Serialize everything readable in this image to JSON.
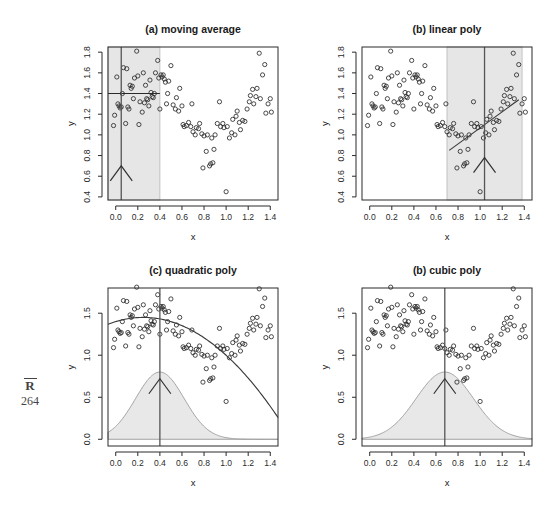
{
  "margin": {
    "label": "R",
    "page_number": "264"
  },
  "figure": {
    "shared_xlabel": "x",
    "shared_ylabel": "y"
  },
  "chart_data": [
    {
      "type": "scatter",
      "panel": "a",
      "title": "(a) moving average",
      "xlabel": "x",
      "ylabel": "y",
      "xlim": [
        -0.07,
        1.47
      ],
      "ylim": [
        0.37,
        1.85
      ],
      "xticks": [
        0.0,
        0.2,
        0.4,
        0.6,
        0.8,
        1.0,
        1.2,
        1.4
      ],
      "xticklabels": [
        "0.0",
        "0.2",
        "0.4",
        "0.6",
        "0.8",
        "1.0",
        "1.2",
        "1.4"
      ],
      "yticks": [
        0.4,
        0.6,
        0.8,
        1.0,
        1.2,
        1.4,
        1.6,
        1.8
      ],
      "yticklabels": [
        "0.4",
        "0.6",
        "0.8",
        "1.0",
        "1.2",
        "1.4",
        "1.6",
        "1.8"
      ],
      "grid": false,
      "legend": "none",
      "annotations": {
        "band": {
          "x_start": -0.07,
          "x_end": 0.4,
          "label": "moving-average window"
        },
        "focus_x": 0.05,
        "horizontal_fit_segment": {
          "y": 1.4,
          "x_start": -0.07,
          "x_end": 0.4
        },
        "arrow_at_x": 0.05,
        "arrow_tip_y": 0.7
      },
      "x": [
        -0.02,
        -0.01,
        0.01,
        0.02,
        0.03,
        0.04,
        0.05,
        0.06,
        0.07,
        0.09,
        0.1,
        0.11,
        0.12,
        0.13,
        0.14,
        0.15,
        0.16,
        0.17,
        0.19,
        0.2,
        0.21,
        0.22,
        0.24,
        0.25,
        0.26,
        0.27,
        0.28,
        0.29,
        0.3,
        0.31,
        0.32,
        0.33,
        0.34,
        0.35,
        0.36,
        0.38,
        0.39,
        0.4,
        0.41,
        0.42,
        0.43,
        0.44,
        0.45,
        0.46,
        0.47,
        0.48,
        0.5,
        0.52,
        0.54,
        0.55,
        0.57,
        0.58,
        0.6,
        0.61,
        0.62,
        0.64,
        0.66,
        0.68,
        0.69,
        0.7,
        0.72,
        0.73,
        0.75,
        0.76,
        0.78,
        0.79,
        0.8,
        0.82,
        0.83,
        0.85,
        0.86,
        0.87,
        0.88,
        0.89,
        0.9,
        0.92,
        0.94,
        0.95,
        0.97,
        0.98,
        1.0,
        1.01,
        1.03,
        1.05,
        1.06,
        1.08,
        1.09,
        1.1,
        1.12,
        1.13,
        1.15,
        1.17,
        1.19,
        1.21,
        1.22,
        1.24,
        1.25,
        1.27,
        1.28,
        1.3,
        1.31,
        1.33,
        1.35,
        1.36,
        1.38,
        1.4,
        1.41
      ],
      "y": [
        1.09,
        1.19,
        1.56,
        1.3,
        1.28,
        1.26,
        1.27,
        1.4,
        1.65,
        1.11,
        1.64,
        1.27,
        1.25,
        1.48,
        1.45,
        1.47,
        1.35,
        1.55,
        1.81,
        1.57,
        1.1,
        1.32,
        1.22,
        1.6,
        1.31,
        1.48,
        1.35,
        1.34,
        1.28,
        1.53,
        1.41,
        1.37,
        1.36,
        1.4,
        1.6,
        1.72,
        1.55,
        1.25,
        1.58,
        1.56,
        1.58,
        1.54,
        1.51,
        1.3,
        1.4,
        1.52,
        1.67,
        1.29,
        1.25,
        1.36,
        1.23,
        1.45,
        1.28,
        1.1,
        1.08,
        1.09,
        1.12,
        1.08,
        1.3,
        1.03,
        1.0,
        1.07,
        1.06,
        1.11,
        1.01,
        0.68,
        0.99,
        0.84,
        1.0,
        0.7,
        0.72,
        0.97,
        0.73,
        0.86,
        1.0,
        1.11,
        1.32,
        1.08,
        1.11,
        1.07,
        0.45,
        1.08,
        0.97,
        1.02,
        1.15,
        1.0,
        1.18,
        1.23,
        1.12,
        1.05,
        1.14,
        1.13,
        1.25,
        1.32,
        1.38,
        1.44,
        1.3,
        1.37,
        1.45,
        1.79,
        1.35,
        1.58,
        1.68,
        1.21,
        1.3,
        1.35,
        1.22
      ]
    },
    {
      "type": "scatter",
      "panel": "b",
      "title": "(b) linear poly",
      "xlabel": "x",
      "ylabel": "y",
      "xlim": [
        -0.07,
        1.47
      ],
      "ylim": [
        0.37,
        1.85
      ],
      "xticks": [
        0.0,
        0.2,
        0.4,
        0.6,
        0.8,
        1.0,
        1.2,
        1.4
      ],
      "xticklabels": [
        "0.0",
        "0.2",
        "0.4",
        "0.6",
        "0.8",
        "1.0",
        "1.2",
        "1.4"
      ],
      "yticks": [
        0.4,
        0.6,
        0.8,
        1.0,
        1.2,
        1.4,
        1.6,
        1.8
      ],
      "yticklabels": [
        "0.4",
        "0.6",
        "0.8",
        "1.0",
        "1.2",
        "1.4",
        "1.6",
        "1.8"
      ],
      "grid": false,
      "legend": "none",
      "annotations": {
        "band": {
          "x_start": 0.7,
          "x_end": 1.38,
          "label": "local linear window"
        },
        "focus_x": 1.04,
        "fit_line": {
          "x_start": 0.72,
          "y_start": 0.85,
          "x_end": 1.35,
          "y_end": 1.34
        },
        "arrow_at_x": 1.04,
        "arrow_tip_y": 0.78
      },
      "x": [
        -0.02,
        -0.01,
        0.01,
        0.02,
        0.03,
        0.04,
        0.05,
        0.06,
        0.07,
        0.09,
        0.1,
        0.11,
        0.12,
        0.13,
        0.14,
        0.15,
        0.16,
        0.17,
        0.19,
        0.2,
        0.21,
        0.22,
        0.24,
        0.25,
        0.26,
        0.27,
        0.28,
        0.29,
        0.3,
        0.31,
        0.32,
        0.33,
        0.34,
        0.35,
        0.36,
        0.38,
        0.39,
        0.4,
        0.41,
        0.42,
        0.43,
        0.44,
        0.45,
        0.46,
        0.47,
        0.48,
        0.5,
        0.52,
        0.54,
        0.55,
        0.57,
        0.58,
        0.6,
        0.61,
        0.62,
        0.64,
        0.66,
        0.68,
        0.69,
        0.7,
        0.72,
        0.73,
        0.75,
        0.76,
        0.78,
        0.79,
        0.8,
        0.82,
        0.83,
        0.85,
        0.86,
        0.87,
        0.88,
        0.89,
        0.9,
        0.92,
        0.94,
        0.95,
        0.97,
        0.98,
        1.0,
        1.01,
        1.03,
        1.05,
        1.06,
        1.08,
        1.09,
        1.1,
        1.12,
        1.13,
        1.15,
        1.17,
        1.19,
        1.21,
        1.22,
        1.24,
        1.25,
        1.27,
        1.28,
        1.3,
        1.31,
        1.33,
        1.35,
        1.36,
        1.38,
        1.4,
        1.41
      ],
      "y": [
        1.09,
        1.19,
        1.56,
        1.3,
        1.28,
        1.26,
        1.27,
        1.4,
        1.65,
        1.11,
        1.64,
        1.27,
        1.25,
        1.48,
        1.45,
        1.47,
        1.35,
        1.55,
        1.81,
        1.57,
        1.1,
        1.32,
        1.22,
        1.6,
        1.31,
        1.48,
        1.35,
        1.34,
        1.28,
        1.53,
        1.41,
        1.37,
        1.36,
        1.4,
        1.6,
        1.72,
        1.55,
        1.25,
        1.58,
        1.56,
        1.58,
        1.54,
        1.51,
        1.3,
        1.4,
        1.52,
        1.67,
        1.29,
        1.25,
        1.36,
        1.23,
        1.45,
        1.28,
        1.1,
        1.08,
        1.09,
        1.12,
        1.08,
        1.3,
        1.03,
        1.0,
        1.07,
        1.06,
        1.11,
        1.01,
        0.68,
        0.99,
        0.84,
        1.0,
        0.7,
        0.72,
        0.97,
        0.73,
        0.86,
        1.0,
        1.11,
        1.32,
        1.08,
        1.11,
        1.07,
        0.45,
        1.08,
        0.97,
        1.02,
        1.15,
        1.0,
        1.18,
        1.23,
        1.12,
        1.05,
        1.14,
        1.13,
        1.25,
        1.32,
        1.38,
        1.44,
        1.3,
        1.37,
        1.45,
        1.79,
        1.35,
        1.58,
        1.68,
        1.21,
        1.3,
        1.35,
        1.22
      ]
    },
    {
      "type": "scatter",
      "panel": "c",
      "title": "(c) quadratic poly",
      "xlabel": "x",
      "ylabel": "y",
      "xlim": [
        -0.07,
        1.47
      ],
      "ylim": [
        -0.08,
        1.8
      ],
      "xticks": [
        0.0,
        0.2,
        0.4,
        0.6,
        0.8,
        1.0,
        1.2,
        1.4
      ],
      "xticklabels": [
        "0.0",
        "0.2",
        "0.4",
        "0.6",
        "0.8",
        "1.0",
        "1.2",
        "1.4"
      ],
      "yticks": [
        0.0,
        0.5,
        1.0,
        1.5
      ],
      "yticklabels": [
        "0.0",
        "0.5",
        "1.0",
        "1.5"
      ],
      "grid": false,
      "legend": "none",
      "annotations": {
        "focus_x": 0.4,
        "kernel": {
          "center": 0.4,
          "bandwidth": 0.22,
          "peak_height": 0.8,
          "shaded": true
        },
        "fit_curve": {
          "form": "quadratic",
          "vertex_x": 0.25,
          "vertex_y": 1.45,
          "curvature": -0.8
        },
        "arrow_at_x": 0.4,
        "arrow_tip_y": 0.72
      },
      "x": [
        -0.02,
        -0.01,
        0.01,
        0.02,
        0.03,
        0.04,
        0.05,
        0.06,
        0.07,
        0.09,
        0.1,
        0.11,
        0.12,
        0.13,
        0.14,
        0.15,
        0.16,
        0.17,
        0.19,
        0.2,
        0.21,
        0.22,
        0.24,
        0.25,
        0.26,
        0.27,
        0.28,
        0.29,
        0.3,
        0.31,
        0.32,
        0.33,
        0.34,
        0.35,
        0.36,
        0.38,
        0.39,
        0.4,
        0.41,
        0.42,
        0.43,
        0.44,
        0.45,
        0.46,
        0.47,
        0.48,
        0.5,
        0.52,
        0.54,
        0.55,
        0.57,
        0.58,
        0.6,
        0.61,
        0.62,
        0.64,
        0.66,
        0.68,
        0.69,
        0.7,
        0.72,
        0.73,
        0.75,
        0.76,
        0.78,
        0.79,
        0.8,
        0.82,
        0.83,
        0.85,
        0.86,
        0.87,
        0.88,
        0.89,
        0.9,
        0.92,
        0.94,
        0.95,
        0.97,
        0.98,
        1.0,
        1.01,
        1.03,
        1.05,
        1.06,
        1.08,
        1.09,
        1.1,
        1.12,
        1.13,
        1.15,
        1.17,
        1.19,
        1.21,
        1.22,
        1.24,
        1.25,
        1.27,
        1.28,
        1.3,
        1.31,
        1.33,
        1.35,
        1.36,
        1.38,
        1.4,
        1.41
      ],
      "y": [
        1.09,
        1.19,
        1.56,
        1.3,
        1.28,
        1.26,
        1.27,
        1.4,
        1.65,
        1.11,
        1.64,
        1.27,
        1.25,
        1.48,
        1.45,
        1.47,
        1.35,
        1.55,
        1.81,
        1.57,
        1.1,
        1.32,
        1.22,
        1.6,
        1.31,
        1.48,
        1.35,
        1.34,
        1.28,
        1.53,
        1.41,
        1.37,
        1.36,
        1.4,
        1.6,
        1.72,
        1.55,
        1.25,
        1.58,
        1.56,
        1.58,
        1.54,
        1.51,
        1.3,
        1.4,
        1.52,
        1.67,
        1.29,
        1.25,
        1.36,
        1.23,
        1.45,
        1.28,
        1.1,
        1.08,
        1.09,
        1.12,
        1.08,
        1.3,
        1.03,
        1.0,
        1.07,
        1.06,
        1.11,
        1.01,
        0.68,
        0.99,
        0.84,
        1.0,
        0.7,
        0.72,
        0.97,
        0.73,
        0.86,
        1.0,
        1.11,
        1.32,
        1.08,
        1.11,
        1.07,
        0.45,
        1.08,
        0.97,
        1.02,
        1.15,
        1.0,
        1.18,
        1.23,
        1.12,
        1.05,
        1.14,
        1.13,
        1.25,
        1.32,
        1.38,
        1.44,
        1.3,
        1.37,
        1.45,
        1.79,
        1.35,
        1.58,
        1.68,
        1.21,
        1.3,
        1.35,
        1.22
      ]
    },
    {
      "type": "scatter",
      "panel": "d",
      "title": "(b) cubic poly",
      "xlabel": "x",
      "ylabel": "y",
      "xlim": [
        -0.07,
        1.47
      ],
      "ylim": [
        -0.08,
        1.8
      ],
      "xticks": [
        0.0,
        0.2,
        0.4,
        0.6,
        0.8,
        1.0,
        1.2,
        1.4
      ],
      "xticklabels": [
        "0.0",
        "0.2",
        "0.4",
        "0.6",
        "0.8",
        "1.0",
        "1.2",
        "1.4"
      ],
      "yticks": [
        0.0,
        0.5,
        1.0,
        1.5
      ],
      "yticklabels": [
        "0.0",
        "0.5",
        "1.0",
        "1.5"
      ],
      "grid": false,
      "legend": "none",
      "annotations": {
        "focus_x": 0.68,
        "kernel": {
          "center": 0.68,
          "bandwidth": 0.26,
          "peak_height": 0.8,
          "shaded": true
        },
        "fit_curve": {
          "form": "cubic",
          "local_max_x": 0.3,
          "local_max_y": 1.51,
          "local_min_x": 1.0,
          "local_min_y": 0.96
        },
        "arrow_at_x": 0.68,
        "arrow_tip_y": 0.72
      },
      "x": [
        -0.02,
        -0.01,
        0.01,
        0.02,
        0.03,
        0.04,
        0.05,
        0.06,
        0.07,
        0.09,
        0.1,
        0.11,
        0.12,
        0.13,
        0.14,
        0.15,
        0.16,
        0.17,
        0.19,
        0.2,
        0.21,
        0.22,
        0.24,
        0.25,
        0.26,
        0.27,
        0.28,
        0.29,
        0.3,
        0.31,
        0.32,
        0.33,
        0.34,
        0.35,
        0.36,
        0.38,
        0.39,
        0.4,
        0.41,
        0.42,
        0.43,
        0.44,
        0.45,
        0.46,
        0.47,
        0.48,
        0.5,
        0.52,
        0.54,
        0.55,
        0.57,
        0.58,
        0.6,
        0.61,
        0.62,
        0.64,
        0.66,
        0.68,
        0.69,
        0.7,
        0.72,
        0.73,
        0.75,
        0.76,
        0.78,
        0.79,
        0.8,
        0.82,
        0.83,
        0.85,
        0.86,
        0.87,
        0.88,
        0.89,
        0.9,
        0.92,
        0.94,
        0.95,
        0.97,
        0.98,
        1.0,
        1.01,
        1.03,
        1.05,
        1.06,
        1.08,
        1.09,
        1.1,
        1.12,
        1.13,
        1.15,
        1.17,
        1.19,
        1.21,
        1.22,
        1.24,
        1.25,
        1.27,
        1.28,
        1.3,
        1.31,
        1.33,
        1.35,
        1.36,
        1.38,
        1.4,
        1.41
      ],
      "y": [
        1.09,
        1.19,
        1.56,
        1.3,
        1.28,
        1.26,
        1.27,
        1.4,
        1.65,
        1.11,
        1.64,
        1.27,
        1.25,
        1.48,
        1.45,
        1.47,
        1.35,
        1.55,
        1.81,
        1.57,
        1.1,
        1.32,
        1.22,
        1.6,
        1.31,
        1.48,
        1.35,
        1.34,
        1.28,
        1.53,
        1.41,
        1.37,
        1.36,
        1.4,
        1.6,
        1.72,
        1.55,
        1.25,
        1.58,
        1.56,
        1.58,
        1.54,
        1.51,
        1.3,
        1.4,
        1.52,
        1.67,
        1.29,
        1.25,
        1.36,
        1.23,
        1.45,
        1.28,
        1.1,
        1.08,
        1.09,
        1.12,
        1.08,
        1.3,
        1.03,
        1.0,
        1.07,
        1.06,
        1.11,
        1.01,
        0.68,
        0.99,
        0.84,
        1.0,
        0.7,
        0.72,
        0.97,
        0.73,
        0.86,
        1.0,
        1.11,
        1.32,
        1.08,
        1.11,
        1.07,
        0.45,
        1.08,
        0.97,
        1.02,
        1.15,
        1.0,
        1.18,
        1.23,
        1.12,
        1.05,
        1.14,
        1.13,
        1.25,
        1.32,
        1.38,
        1.44,
        1.3,
        1.37,
        1.45,
        1.79,
        1.35,
        1.58,
        1.68,
        1.21,
        1.3,
        1.35,
        1.22
      ]
    }
  ]
}
